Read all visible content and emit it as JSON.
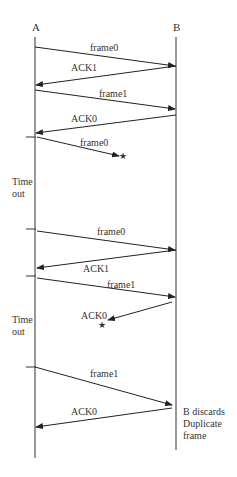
{
  "nodes": {
    "a": {
      "label": "A"
    },
    "b": {
      "label": "B"
    }
  },
  "messages": [
    {
      "label": "frame0",
      "from": "A",
      "to": "B",
      "status": "delivered"
    },
    {
      "label": "ACK1",
      "from": "B",
      "to": "A",
      "status": "delivered"
    },
    {
      "label": "frame1",
      "from": "A",
      "to": "B",
      "status": "delivered"
    },
    {
      "label": "ACK0",
      "from": "B",
      "to": "A",
      "status": "delivered"
    },
    {
      "label": "frame0",
      "from": "A",
      "to": "B",
      "status": "lost"
    },
    {
      "label": "frame0",
      "from": "A",
      "to": "B",
      "status": "delivered"
    },
    {
      "label": "ACK1",
      "from": "B",
      "to": "A",
      "status": "delivered"
    },
    {
      "label": "frame1",
      "from": "A",
      "to": "B",
      "status": "delivered"
    },
    {
      "label": "ACK0",
      "from": "B",
      "to": "A",
      "status": "lost"
    },
    {
      "label": "frame1",
      "from": "A",
      "to": "B",
      "status": "delivered"
    },
    {
      "label": "ACK0",
      "from": "B",
      "to": "A",
      "status": "delivered"
    }
  ],
  "timeouts": [
    {
      "line1": "Time",
      "line2": "out"
    },
    {
      "line1": "Time",
      "line2": "out"
    }
  ],
  "notes": {
    "b_discard": {
      "line1": "B discards",
      "line2": "Duplicate",
      "line3": "frame"
    }
  },
  "loss_marker": "★"
}
